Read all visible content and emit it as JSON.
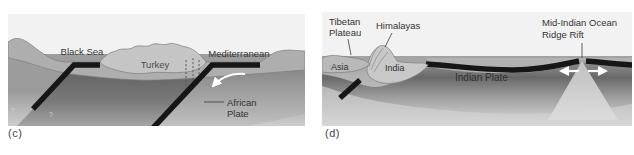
{
  "figure": {
    "panel_c": {
      "id_label": "(c)",
      "labels": {
        "black_sea": "Black Sea",
        "turkey": "Turkey",
        "mediterranean": "Mediterranean",
        "african_plate_line1": "African",
        "african_plate_line2": "Plate",
        "question_mark_1": "?",
        "question_mark_2": "?"
      }
    },
    "panel_d": {
      "id_label": "(d)",
      "labels": {
        "tibetan_plateau_line1": "Tibetan",
        "tibetan_plateau_line2": "Plateau",
        "himalayas": "Himalayas",
        "asia": "Asia",
        "india": "India",
        "indian_plate": "Indian Plate",
        "ridge_line1": "Mid-Indian Ocean",
        "ridge_line2": "Ridge Rift"
      }
    },
    "colors": {
      "background": "#ffffff",
      "sky": "#f2f2f2",
      "crust_gray": "#aeaeae",
      "landmass_light_gray": "#c5c5c5",
      "plate_dark_gray": "#696969",
      "slab_black": "#161616",
      "arrow_white": "#ffffff",
      "rift_wedge": "#d0d0d0",
      "label_text": "#333333"
    }
  }
}
